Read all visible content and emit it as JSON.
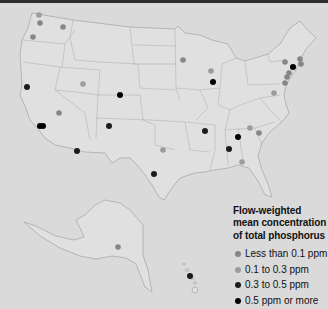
{
  "legend": {
    "title_lines": [
      "Flow-weighted",
      "mean concentration",
      "of total phosphorus"
    ],
    "items": [
      {
        "label": "Less than 0.1 ppm",
        "category": "lt_0_1",
        "color": "#868686"
      },
      {
        "label": "0.1 to 0.3 ppm",
        "category": "0_1_to_0_3",
        "color": "#9c9c9c"
      },
      {
        "label": "0.3 to 0.5 ppm",
        "category": "0_3_to_0_5",
        "color": "#1c1c1c"
      },
      {
        "label": "0.5 ppm or more",
        "category": "gte_0_5",
        "color": "#000000"
      }
    ]
  },
  "map": {
    "region": "United States (Lower 48, Alaska, Hawaii)",
    "sites": [
      {
        "x": 39,
        "y": 15,
        "category": "0_1_to_0_3"
      },
      {
        "x": 40,
        "y": 23,
        "category": "lt_0_1"
      },
      {
        "x": 63,
        "y": 27,
        "category": "lt_0_1"
      },
      {
        "x": 33,
        "y": 37,
        "category": "lt_0_1"
      },
      {
        "x": 27,
        "y": 87,
        "category": "0_3_to_0_5"
      },
      {
        "x": 83,
        "y": 84,
        "category": "0_1_to_0_3"
      },
      {
        "x": 120,
        "y": 95,
        "category": "gte_0_5"
      },
      {
        "x": 59,
        "y": 113,
        "category": "lt_0_1"
      },
      {
        "x": 40,
        "y": 126,
        "category": "gte_0_5"
      },
      {
        "x": 43,
        "y": 126,
        "category": "gte_0_5"
      },
      {
        "x": 109,
        "y": 126,
        "category": "0_3_to_0_5"
      },
      {
        "x": 77,
        "y": 151,
        "category": "0_3_to_0_5"
      },
      {
        "x": 163,
        "y": 150,
        "category": "0_1_to_0_3"
      },
      {
        "x": 154,
        "y": 174,
        "category": "0_3_to_0_5"
      },
      {
        "x": 183,
        "y": 60,
        "category": "lt_0_1"
      },
      {
        "x": 211,
        "y": 71,
        "category": "0_1_to_0_3"
      },
      {
        "x": 213,
        "y": 82,
        "category": "gte_0_5"
      },
      {
        "x": 205,
        "y": 131,
        "category": "0_3_to_0_5"
      },
      {
        "x": 250,
        "y": 128,
        "category": "0_1_to_0_3"
      },
      {
        "x": 259,
        "y": 133,
        "category": "lt_0_1"
      },
      {
        "x": 238,
        "y": 137,
        "category": "gte_0_5"
      },
      {
        "x": 229,
        "y": 149,
        "category": "0_3_to_0_5"
      },
      {
        "x": 242,
        "y": 162,
        "category": "0_1_to_0_3"
      },
      {
        "x": 285,
        "y": 62,
        "category": "lt_0_1"
      },
      {
        "x": 300,
        "y": 59,
        "category": "lt_0_1"
      },
      {
        "x": 301,
        "y": 64,
        "category": "lt_0_1"
      },
      {
        "x": 293,
        "y": 67,
        "category": "gte_0_5"
      },
      {
        "x": 289,
        "y": 73,
        "category": "lt_0_1"
      },
      {
        "x": 287,
        "y": 77,
        "category": "lt_0_1"
      },
      {
        "x": 285,
        "y": 83,
        "category": "lt_0_1"
      },
      {
        "x": 274,
        "y": 93,
        "category": "0_1_to_0_3"
      },
      {
        "x": 118,
        "y": 247,
        "category": "lt_0_1"
      },
      {
        "x": 190,
        "y": 276,
        "category": "0_3_to_0_5"
      }
    ]
  }
}
